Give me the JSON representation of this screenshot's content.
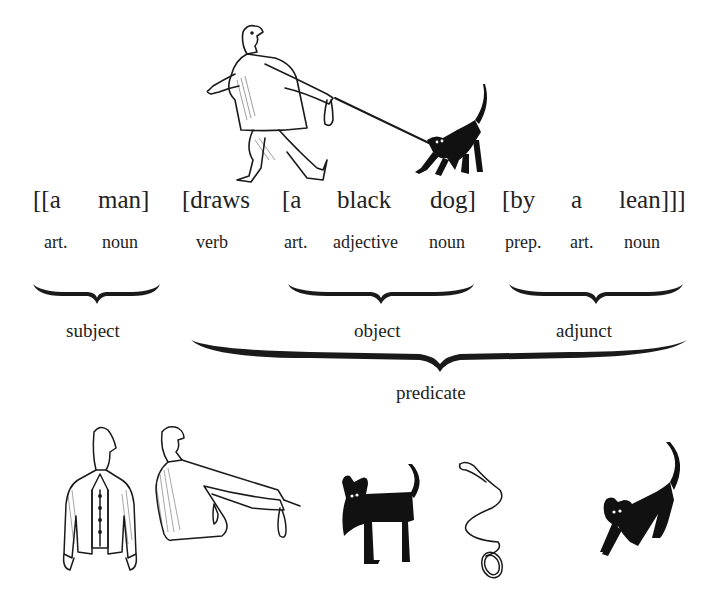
{
  "diagram": {
    "type": "sentence-constituent-structure",
    "sentence": {
      "words": [
        {
          "text": "[[a",
          "pos": "art."
        },
        {
          "text": "man]",
          "pos": "noun"
        },
        {
          "text": "[draws",
          "pos": "verb"
        },
        {
          "text": "[a",
          "pos": "art."
        },
        {
          "text": "black",
          "pos": "adjective"
        },
        {
          "text": "dog]",
          "pos": "noun"
        },
        {
          "text": "[by",
          "pos": "prep."
        },
        {
          "text": "a",
          "pos": "art."
        },
        {
          "text": "lean]]]",
          "pos": "noun"
        }
      ]
    },
    "groups": {
      "subject": "subject",
      "object": "object",
      "adjunct": "adjunct",
      "predicate": "predicate"
    },
    "illustrations": {
      "top": "man-walking-dog-on-leash",
      "bottom": [
        "man-front-view",
        "man-arm-outstretched-holding-leash",
        "black-dog-standing",
        "leash",
        "black-dog-pulling"
      ]
    },
    "colors": {
      "ink": "#1a1a1a",
      "background": "#ffffff"
    }
  }
}
